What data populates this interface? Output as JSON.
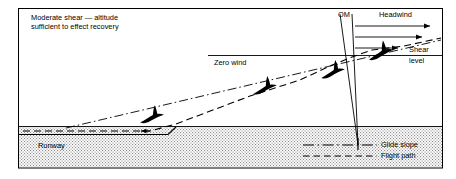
{
  "figure": {
    "kind": "wind-shear-approach-diagram",
    "frame": {
      "x": 18,
      "y": 8,
      "width": 425,
      "height": 160,
      "stroke": "#000000"
    },
    "colors": {
      "ink": "#000000",
      "paper": "#ffffff",
      "ground_fill": "#d9d9d9",
      "aircraft": "#000000"
    },
    "title": "Moderate shear — altitude\nsufficient to effect recovery",
    "labels": {
      "zero_wind": "Zero wind",
      "outer_marker": "OM",
      "headwind": "Headwind",
      "shear": "Shear",
      "level": "level",
      "runway": "Runway"
    },
    "legend": {
      "items": [
        {
          "label": "Glide slope",
          "style": "dash-dot"
        },
        {
          "label": "Flight path",
          "style": "dashed"
        }
      ]
    },
    "shear_level_line": {
      "x1": 208,
      "x2": 443,
      "y": 55
    },
    "ground": {
      "top_y": 126,
      "bottom_y": 168,
      "x1": 19,
      "x2": 442
    },
    "runway_surface": {
      "x1": 19,
      "x2": 168,
      "y": 134
    },
    "headwind_arrows": [
      {
        "x1": 355,
        "x2": 432,
        "y": 26
      },
      {
        "x1": 355,
        "x2": 424,
        "y": 37
      },
      {
        "x1": 355,
        "x2": 400,
        "y": 48
      }
    ],
    "outer_marker_cone": {
      "apex_x": 358,
      "apex_y": 145,
      "left_x": 340,
      "right_x": 352,
      "top_y": 14
    },
    "glide_slope": {
      "x1": 66,
      "y1": 128,
      "x2": 441,
      "y2": 40
    },
    "flight_path": [
      [
        23,
        131
      ],
      [
        150,
        131
      ],
      [
        176,
        124
      ],
      [
        250,
        96
      ],
      [
        300,
        80
      ],
      [
        330,
        66
      ],
      [
        352,
        57
      ],
      [
        372,
        50
      ],
      [
        404,
        46
      ],
      [
        441,
        38
      ]
    ],
    "aircraft": [
      {
        "x": 152,
        "y": 117,
        "rot": -20,
        "scale": 1.0
      },
      {
        "x": 265,
        "y": 88,
        "rot": -22,
        "scale": 1.0
      },
      {
        "x": 333,
        "y": 72,
        "rot": -22,
        "scale": 1.0
      },
      {
        "x": 380,
        "y": 53,
        "rot": -24,
        "scale": 1.05
      }
    ]
  }
}
